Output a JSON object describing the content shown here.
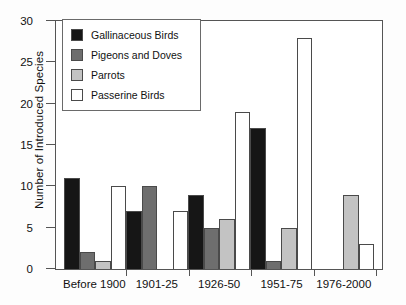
{
  "chart_data": {
    "type": "bar",
    "title": "",
    "xlabel": "",
    "ylabel": "Number of Introduced Species",
    "ylim": [
      0,
      30
    ],
    "yticks": [
      0,
      5,
      10,
      15,
      20,
      25,
      30
    ],
    "grid": false,
    "legend_position": "top-left inside",
    "categories": [
      "Before 1900",
      "1901-25",
      "1926-50",
      "1951-75",
      "1976-2000"
    ],
    "series": [
      {
        "name": "Gallinaceous Birds",
        "color": "#161616",
        "values": [
          11,
          7,
          9,
          17,
          0
        ]
      },
      {
        "name": "Pigeons and Doves",
        "color": "#6e6e6e",
        "values": [
          2,
          10,
          5,
          1,
          0
        ]
      },
      {
        "name": "Parrots",
        "color": "#c3c3c3",
        "values": [
          1,
          0,
          6,
          5,
          9
        ]
      },
      {
        "name": "Passerine Birds",
        "color": "#ffffff",
        "values": [
          10,
          7,
          19,
          28,
          3
        ]
      }
    ]
  }
}
